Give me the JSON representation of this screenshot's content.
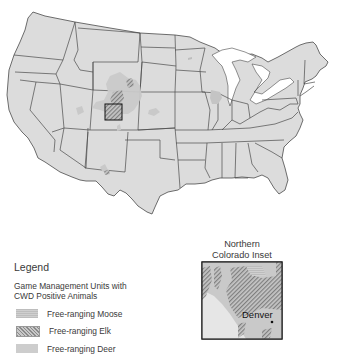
{
  "map": {
    "subject": "United States — Chronic Wasting Disease (CWD) positive game management units",
    "colors": {
      "land": "#dcdcdc",
      "state_border": "#4a4a4a",
      "water": "#ffffff",
      "moose": "#c4c4c4",
      "elk_hatch_dark": "#7f7f7f",
      "elk_hatch_light": "#c6c6c6",
      "deer": "#c9c9c9",
      "inset_frame": "#222222"
    },
    "highlights": [
      {
        "region": "Northern Colorado / southeastern Wyoming",
        "types": [
          "moose",
          "elk",
          "deer"
        ]
      },
      {
        "region": "Western Nebraska",
        "types": [
          "deer"
        ]
      },
      {
        "region": "Southern Wisconsin / northern Illinois",
        "types": [
          "deer"
        ]
      },
      {
        "region": "Southern New Mexico",
        "types": [
          "deer",
          "elk"
        ]
      },
      {
        "region": "Eastern Utah",
        "types": [
          "deer"
        ]
      },
      {
        "region": "Northern Minnesota spot",
        "types": [
          "deer"
        ]
      }
    ]
  },
  "legend": {
    "title": "Legend",
    "subtitle_line1": "Game Management Units with",
    "subtitle_line2": "CWD Positive Animals",
    "items": [
      {
        "key": "moose",
        "label": "Free-ranging Moose"
      },
      {
        "key": "elk",
        "label": "Free-ranging Elk"
      },
      {
        "key": "deer",
        "label": "Free-ranging Deer"
      }
    ]
  },
  "inset": {
    "title_line1": "Northern",
    "title_line2": "Colorado Inset",
    "city_label": "Denver"
  }
}
